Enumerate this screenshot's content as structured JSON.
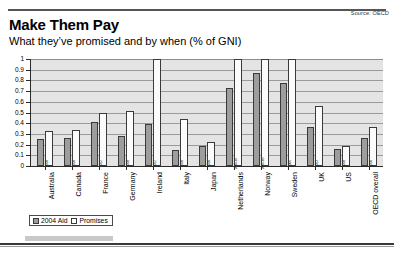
{
  "header": {
    "headline": "Make Them Pay",
    "subhead": "What they’ve promised and by when (% of GNI)",
    "source": "Source: OECD"
  },
  "legend": {
    "aid_label": "2004 Aid",
    "promise_label": "Promises"
  },
  "chart_data": {
    "type": "bar",
    "title": "Make Them Pay",
    "subtitle": "What they’ve promised and by when (% of GNI)",
    "xlabel": "",
    "ylabel": "% of GNI",
    "ylim": [
      0,
      1
    ],
    "yticks": [
      "0",
      "0.1",
      "0.2",
      "0.3",
      "0.4",
      "0.5",
      "0.6",
      "0.7",
      "0.8",
      "0.9",
      "1"
    ],
    "grid": true,
    "legend_position": "bottom-left",
    "categories": [
      "Australia",
      "Canada",
      "France",
      "Germany",
      "Ireland",
      "Italy",
      "Japan",
      "Netherlands",
      "Norway",
      "Sweden",
      "UK",
      "US",
      "OECD overall"
    ],
    "target_years": [
      "2010",
      "2010",
      "2012",
      "2010",
      "2012",
      "2010",
      "2010",
      "2004-07",
      "2006-09",
      "2006",
      "2013",
      "2010",
      "2010"
    ],
    "series": [
      {
        "name": "2004 Aid",
        "values": [
          0.25,
          0.26,
          0.41,
          0.28,
          0.39,
          0.15,
          0.19,
          0.73,
          0.87,
          0.78,
          0.36,
          0.16,
          0.26
        ]
      },
      {
        "name": "Promises",
        "values": [
          0.33,
          0.34,
          0.5,
          0.51,
          1.0,
          0.44,
          0.22,
          1.0,
          1.0,
          1.0,
          0.56,
          0.19,
          0.36
        ]
      }
    ]
  }
}
